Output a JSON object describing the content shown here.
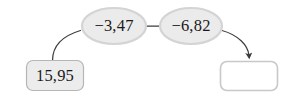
{
  "diagram": {
    "type": "function-machine-flow",
    "canvas": {
      "width": 287,
      "height": 96,
      "background": "#ffffff"
    },
    "colors": {
      "ellipse_fill": "#ebebeb",
      "ellipse_stroke": "#d0d0d0",
      "input_box_fill": "#ececec",
      "input_box_stroke": "#b4b4b4",
      "output_box_fill": "#ffffff",
      "output_box_stroke": "#c8c8c8",
      "arrow_stroke": "#3c3c3c",
      "text": "#1a1a1a"
    },
    "nodes": {
      "input_box": {
        "label": "15,95",
        "value": "15,95",
        "shape": "rounded-rect",
        "filled": true
      },
      "operation_1": {
        "label": "−3,47",
        "operator": "−",
        "operand": "3,47",
        "shape": "ellipse"
      },
      "operation_2": {
        "label": "−6,82",
        "operator": "−",
        "operand": "6,82",
        "shape": "ellipse"
      },
      "output_box": {
        "label": "",
        "value": "",
        "shape": "rounded-rect",
        "filled": false,
        "empty": true
      }
    },
    "connectors": [
      {
        "name": "input-to-op1",
        "from": "input_box",
        "to": "operation_1",
        "arrowhead": false
      },
      {
        "name": "op1-to-op2",
        "from": "operation_1",
        "to": "operation_2",
        "arrowhead": false
      },
      {
        "name": "op2-to-output",
        "from": "operation_2",
        "to": "output_box",
        "arrowhead": true
      }
    ]
  }
}
